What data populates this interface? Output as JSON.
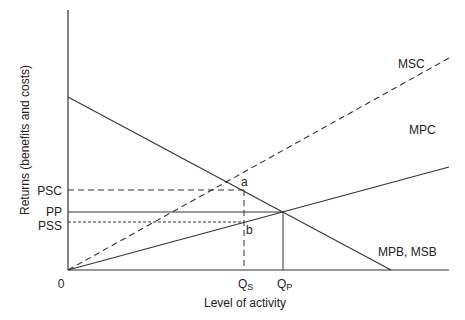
{
  "diagram": {
    "ylabel": "Returns (benefits and costs)",
    "xlabel": "Level of activity",
    "origin_label": "0",
    "y_labels": {
      "psc": "PSC",
      "pp": "PP",
      "pss": "PSS"
    },
    "x_labels": {
      "qs": "Q",
      "qs_sub": "S",
      "qp": "Q",
      "qp_sub": "P"
    },
    "curve_labels": {
      "msc": "MSC",
      "mpc": "MPC",
      "mpb": "MPB, MSB"
    },
    "point_labels": {
      "a": "a",
      "b": "b"
    },
    "colors": {
      "line": "#333333",
      "text": "#222222",
      "background": "#ffffff"
    }
  }
}
